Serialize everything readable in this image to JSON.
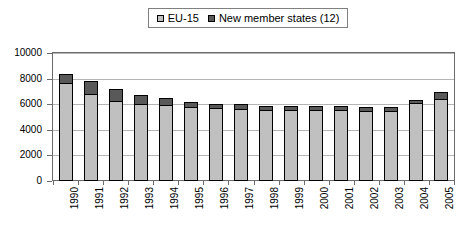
{
  "chart_data": {
    "type": "bar",
    "stacked": true,
    "title": "",
    "subtitle": "",
    "xlabel": "",
    "ylabel": "",
    "ylim": [
      0,
      10000
    ],
    "ytick_labels": [
      "10000",
      "8000",
      "6000",
      "4000",
      "2000",
      "0"
    ],
    "ytick_values": [
      10000,
      8000,
      6000,
      4000,
      2000,
      0
    ],
    "grid": true,
    "legend_position": "top-center",
    "categories": [
      "1990",
      "1991",
      "1992",
      "1993",
      "1994",
      "1995",
      "1996",
      "1997",
      "1998",
      "1999",
      "2000",
      "2001",
      "2002",
      "2003",
      "2004",
      "2005"
    ],
    "series": [
      {
        "name": "EU-15",
        "color": "#c0c0c0",
        "values": [
          7550,
          6750,
          6200,
          5900,
          5850,
          5700,
          5600,
          5550,
          5450,
          5450,
          5500,
          5450,
          5400,
          5400,
          6000,
          6350
        ]
      },
      {
        "name": "New member states (12)",
        "color": "#595959",
        "values": [
          850,
          1050,
          1000,
          800,
          650,
          500,
          450,
          450,
          450,
          400,
          350,
          400,
          350,
          350,
          350,
          600
        ]
      }
    ],
    "totals": [
      8400,
      7800,
      7200,
      6700,
      6500,
      6200,
      6050,
      6000,
      5900,
      5850,
      5850,
      5850,
      5750,
      5750,
      6350,
      6950
    ]
  },
  "legend": {
    "entries": [
      {
        "label": "EU-15",
        "swatch_name": "legend-swatch-eu15",
        "color": "#c0c0c0"
      },
      {
        "label": "New member states (12)",
        "swatch_name": "legend-swatch-new-member-states",
        "color": "#595959"
      }
    ]
  },
  "colors": {
    "series_light": "#c0c0c0",
    "series_dark": "#595959",
    "gridline": "#b5b5b5",
    "axis": "#6b6b6b",
    "bar_border": "#000000",
    "background": "#ffffff"
  }
}
